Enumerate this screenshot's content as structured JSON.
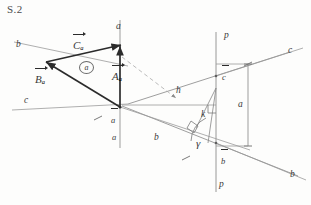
{
  "figure": {
    "title": "S.2",
    "kind": "descriptive-geometry-construction"
  },
  "labels": {
    "axis_a_top": "a",
    "trace_b_upper_left": "b",
    "trace_c_left": "c",
    "trace_c_right": "c",
    "trace_b_right": "b",
    "trace_p_top": "p",
    "trace_p_bottom": "p",
    "vector_C": "C",
    "vector_C_sub": "a",
    "vector_B": "B",
    "vector_B_sub": "a",
    "vector_A": "A",
    "vector_A_sub": "a",
    "plane_marker": "a",
    "apex_a_bar": "a",
    "segment_a_lower": "a",
    "segment_b_lower": "b",
    "height_h": "h",
    "c_bar": "c",
    "a_right": "a",
    "k": "k",
    "gamma": "γ",
    "b_bar": "b"
  },
  "colors": {
    "paper": "#fdfdfc",
    "ink_dark": "#2b2b2b",
    "ink_light": "#8d8d8d",
    "ink_mid": "#5f5f5f",
    "dashed": "#9a9a9a"
  }
}
